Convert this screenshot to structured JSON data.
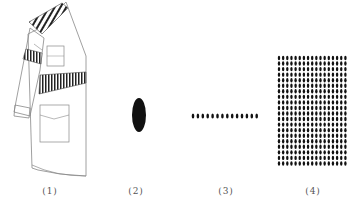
{
  "figure": {
    "panels": [
      {
        "id": "1",
        "label": "(1)",
        "caption_x": 50,
        "description": "coat-drawing-with-striped-bands"
      },
      {
        "id": "2",
        "label": "(2)",
        "caption_x": 136,
        "description": "single-ellipse"
      },
      {
        "id": "3",
        "label": "(3)",
        "caption_x": 226,
        "description": "row-of-dots"
      },
      {
        "id": "4",
        "label": "(4)",
        "caption_x": 313,
        "description": "grid-of-dots"
      }
    ],
    "row_dots": {
      "count": 14,
      "x_start": 193,
      "x_step": 4.9,
      "y": 116
    },
    "grid_dots": {
      "cols": 17,
      "rows": 20,
      "x_start": 279,
      "y_start": 58,
      "x_step": 4.15,
      "y_step": 5.55
    },
    "colors": {
      "ink": "#111111",
      "line": "#777777",
      "caption": "#555555",
      "background": "#ffffff"
    }
  }
}
